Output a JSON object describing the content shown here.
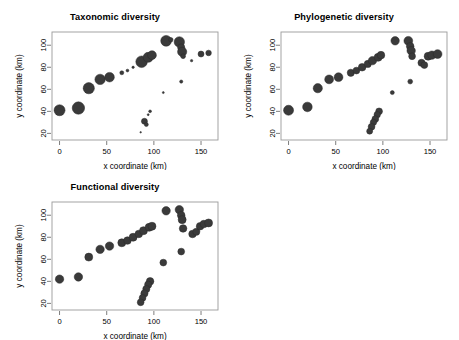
{
  "figure": {
    "background_color": "#ffffff",
    "bubble_fill": "#3a3a3a",
    "frame_color": "#9a9a9a",
    "panel_count": 3
  },
  "chart_data": [
    {
      "type": "scatter",
      "title": "Taxonomic diversity",
      "xlabel": "x coordinate (km)",
      "ylabel": "y coordinate (km)",
      "xlim": [
        -8,
        168
      ],
      "ylim": [
        14,
        112
      ],
      "xticks": [
        0,
        50,
        100,
        150
      ],
      "yticks": [
        20,
        40,
        60,
        80,
        100
      ],
      "grid": false,
      "legend": "none",
      "size_encoding": "bubble area proportional to taxonomic diversity",
      "points": [
        {
          "x": 0,
          "y": 41,
          "size": 5.5
        },
        {
          "x": 20,
          "y": 43,
          "size": 6.2
        },
        {
          "x": 31,
          "y": 61,
          "size": 5.6
        },
        {
          "x": 43,
          "y": 69,
          "size": 5.2
        },
        {
          "x": 53,
          "y": 71,
          "size": 4.8
        },
        {
          "x": 66,
          "y": 75,
          "size": 2.0
        },
        {
          "x": 72,
          "y": 77,
          "size": 1.4
        },
        {
          "x": 78,
          "y": 80,
          "size": 1.2
        },
        {
          "x": 87,
          "y": 85,
          "size": 5.8
        },
        {
          "x": 94,
          "y": 89,
          "size": 5.0
        },
        {
          "x": 98,
          "y": 91,
          "size": 4.4
        },
        {
          "x": 113,
          "y": 104,
          "size": 5.4
        },
        {
          "x": 118,
          "y": 105,
          "size": 2.2
        },
        {
          "x": 127,
          "y": 103,
          "size": 5.2
        },
        {
          "x": 129,
          "y": 98,
          "size": 3.6
        },
        {
          "x": 130,
          "y": 94,
          "size": 4.6
        },
        {
          "x": 131,
          "y": 90,
          "size": 2.4
        },
        {
          "x": 140,
          "y": 86,
          "size": 1.2
        },
        {
          "x": 150,
          "y": 92,
          "size": 3.0
        },
        {
          "x": 158,
          "y": 93,
          "size": 2.8
        },
        {
          "x": 129,
          "y": 67,
          "size": 1.6
        },
        {
          "x": 110,
          "y": 57,
          "size": 1.0
        },
        {
          "x": 96,
          "y": 40,
          "size": 1.4
        },
        {
          "x": 94,
          "y": 37,
          "size": 1.0
        },
        {
          "x": 90,
          "y": 31,
          "size": 3.0
        },
        {
          "x": 92,
          "y": 28,
          "size": 2.0
        },
        {
          "x": 86,
          "y": 21,
          "size": 0.8
        }
      ]
    },
    {
      "type": "scatter",
      "title": "Phylogenetic diversity",
      "xlabel": "x coordinate (km)",
      "ylabel": "y coordinate (km)",
      "xlim": [
        -8,
        168
      ],
      "ylim": [
        14,
        112
      ],
      "xticks": [
        0,
        50,
        100,
        150
      ],
      "yticks": [
        20,
        40,
        60,
        80,
        100
      ],
      "grid": false,
      "legend": "none",
      "size_encoding": "bubble area proportional to phylogenetic diversity",
      "points": [
        {
          "x": 0,
          "y": 41,
          "size": 5.0
        },
        {
          "x": 20,
          "y": 44,
          "size": 4.8
        },
        {
          "x": 31,
          "y": 61,
          "size": 4.6
        },
        {
          "x": 43,
          "y": 69,
          "size": 4.4
        },
        {
          "x": 53,
          "y": 71,
          "size": 4.4
        },
        {
          "x": 66,
          "y": 75,
          "size": 3.6
        },
        {
          "x": 72,
          "y": 77,
          "size": 3.4
        },
        {
          "x": 78,
          "y": 80,
          "size": 3.8
        },
        {
          "x": 84,
          "y": 83,
          "size": 3.6
        },
        {
          "x": 89,
          "y": 86,
          "size": 4.2
        },
        {
          "x": 95,
          "y": 89,
          "size": 4.0
        },
        {
          "x": 98,
          "y": 91,
          "size": 3.8
        },
        {
          "x": 113,
          "y": 104,
          "size": 4.2
        },
        {
          "x": 127,
          "y": 104,
          "size": 4.4
        },
        {
          "x": 129,
          "y": 99,
          "size": 3.8
        },
        {
          "x": 130,
          "y": 95,
          "size": 4.2
        },
        {
          "x": 131,
          "y": 90,
          "size": 3.4
        },
        {
          "x": 141,
          "y": 84,
          "size": 3.6
        },
        {
          "x": 144,
          "y": 82,
          "size": 3.4
        },
        {
          "x": 148,
          "y": 90,
          "size": 4.0
        },
        {
          "x": 152,
          "y": 91,
          "size": 4.2
        },
        {
          "x": 158,
          "y": 92,
          "size": 4.4
        },
        {
          "x": 129,
          "y": 67,
          "size": 2.4
        },
        {
          "x": 110,
          "y": 57,
          "size": 2.0
        },
        {
          "x": 96,
          "y": 40,
          "size": 3.4
        },
        {
          "x": 94,
          "y": 37,
          "size": 3.2
        },
        {
          "x": 92,
          "y": 33,
          "size": 3.4
        },
        {
          "x": 90,
          "y": 30,
          "size": 3.2
        },
        {
          "x": 88,
          "y": 26,
          "size": 3.4
        },
        {
          "x": 86,
          "y": 22,
          "size": 3.0
        }
      ]
    },
    {
      "type": "scatter",
      "title": "Functional diversity",
      "xlabel": "x coordinate (km)",
      "ylabel": "y coordinate (km)",
      "xlim": [
        -8,
        168
      ],
      "ylim": [
        14,
        112
      ],
      "xticks": [
        0,
        50,
        100,
        150
      ],
      "yticks": [
        20,
        40,
        60,
        80,
        100
      ],
      "grid": false,
      "legend": "none",
      "size_encoding": "bubble area proportional to functional diversity",
      "points": [
        {
          "x": 0,
          "y": 42,
          "size": 4.2
        },
        {
          "x": 20,
          "y": 44,
          "size": 4.2
        },
        {
          "x": 31,
          "y": 62,
          "size": 4.0
        },
        {
          "x": 43,
          "y": 69,
          "size": 4.2
        },
        {
          "x": 53,
          "y": 72,
          "size": 4.2
        },
        {
          "x": 66,
          "y": 75,
          "size": 4.0
        },
        {
          "x": 72,
          "y": 77,
          "size": 3.8
        },
        {
          "x": 78,
          "y": 80,
          "size": 4.0
        },
        {
          "x": 84,
          "y": 83,
          "size": 3.8
        },
        {
          "x": 89,
          "y": 86,
          "size": 4.0
        },
        {
          "x": 95,
          "y": 89,
          "size": 4.0
        },
        {
          "x": 98,
          "y": 90,
          "size": 4.0
        },
        {
          "x": 113,
          "y": 104,
          "size": 4.2
        },
        {
          "x": 127,
          "y": 105,
          "size": 4.2
        },
        {
          "x": 129,
          "y": 100,
          "size": 3.8
        },
        {
          "x": 130,
          "y": 96,
          "size": 4.0
        },
        {
          "x": 131,
          "y": 88,
          "size": 3.8
        },
        {
          "x": 141,
          "y": 83,
          "size": 3.8
        },
        {
          "x": 145,
          "y": 85,
          "size": 3.6
        },
        {
          "x": 149,
          "y": 90,
          "size": 3.8
        },
        {
          "x": 153,
          "y": 92,
          "size": 3.8
        },
        {
          "x": 158,
          "y": 93,
          "size": 4.0
        },
        {
          "x": 129,
          "y": 67,
          "size": 3.4
        },
        {
          "x": 110,
          "y": 57,
          "size": 3.4
        },
        {
          "x": 96,
          "y": 40,
          "size": 3.8
        },
        {
          "x": 94,
          "y": 37,
          "size": 3.6
        },
        {
          "x": 92,
          "y": 33,
          "size": 3.6
        },
        {
          "x": 90,
          "y": 29,
          "size": 3.6
        },
        {
          "x": 88,
          "y": 25,
          "size": 3.4
        },
        {
          "x": 86,
          "y": 21,
          "size": 3.4
        }
      ]
    }
  ]
}
